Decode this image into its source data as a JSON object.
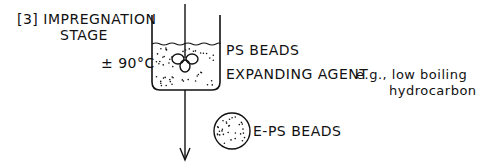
{
  "diagram": {
    "stage_label_line1": "[3] IMPREGNATION",
    "stage_label_line2": "STAGE",
    "temperature": "± 90°C",
    "beaker_content_1": "PS BEADS",
    "beaker_content_2_main": "EXPANDING AGENT",
    "beaker_content_2_example_line1": "e.g., low boiling",
    "beaker_content_2_example_line2": "hydrocarbon",
    "product_label": "E-PS BEADS"
  },
  "colors": {
    "ink": "#111111",
    "background": "#ffffff"
  }
}
